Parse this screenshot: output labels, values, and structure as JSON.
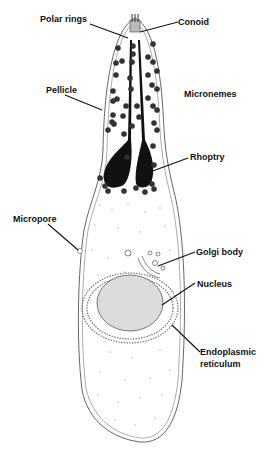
{
  "diagram": {
    "labels": {
      "polar_rings": "Polar rings",
      "conoid": "Conoid",
      "pellicle": "Pellicle",
      "micronemes": "Micronemes",
      "rhoptry": "Rhoptry",
      "micropore": "Micropore",
      "golgi_body": "Golgi body",
      "nucleus": "Nucleus",
      "er_line1": "Endoplasmic",
      "er_line2": "reticulum"
    },
    "colors": {
      "outline": "#555555",
      "rhoptry": "#111111",
      "nucleus_fill": "#dcdcdc",
      "text": "#111111"
    }
  }
}
